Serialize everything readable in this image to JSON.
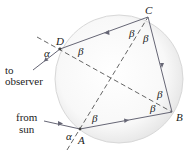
{
  "diagram": {
    "points": {
      "A": {
        "label": "A",
        "x": 80,
        "y": 129
      },
      "B": {
        "label": "B",
        "x": 172,
        "y": 112
      },
      "C": {
        "label": "C",
        "x": 148,
        "y": 17
      },
      "D": {
        "label": "D",
        "x": 60,
        "y": 49
      }
    },
    "angles": {
      "alpha_top": "α",
      "alpha_bottom": "α",
      "beta_D": "β",
      "beta_C_left": "β",
      "beta_C_right": "β",
      "beta_B_upper": "β",
      "beta_B_lower": "β",
      "beta_A": "β"
    },
    "labels": {
      "to_line1": "to",
      "to_line2": "observer",
      "from_line1": "from",
      "from_line2": "sun"
    },
    "colors": {
      "ray": "#6b6b7a",
      "circle_fill": "#ececec",
      "circle_stroke": "#d6d6d6",
      "text": "#222222"
    }
  }
}
